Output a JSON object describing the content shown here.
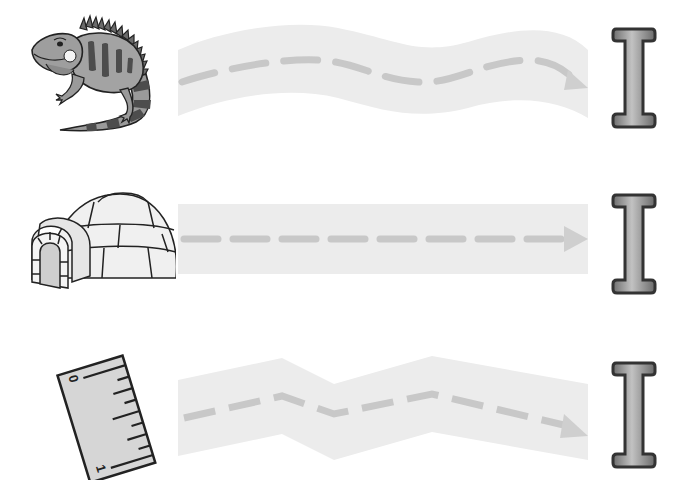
{
  "worksheet": {
    "rows": [
      {
        "picture": "iguana",
        "picture_label": "iguana",
        "path_shape": "wavy",
        "target_letter": "I"
      },
      {
        "picture": "igloo",
        "picture_label": "igloo",
        "path_shape": "straight",
        "target_letter": "I"
      },
      {
        "picture": "ruler",
        "picture_label": "ruler",
        "path_shape": "zigzag",
        "target_letter": "I",
        "ruler_marks": [
          "0",
          "1"
        ]
      }
    ]
  },
  "colors": {
    "path_fill": "#ececec",
    "dash": "#c8c8c8",
    "letter_fill": "#9a9a9a",
    "letter_outline": "#3a3a3a",
    "picture_gray": "#8c8c8c",
    "outline": "#222222"
  }
}
